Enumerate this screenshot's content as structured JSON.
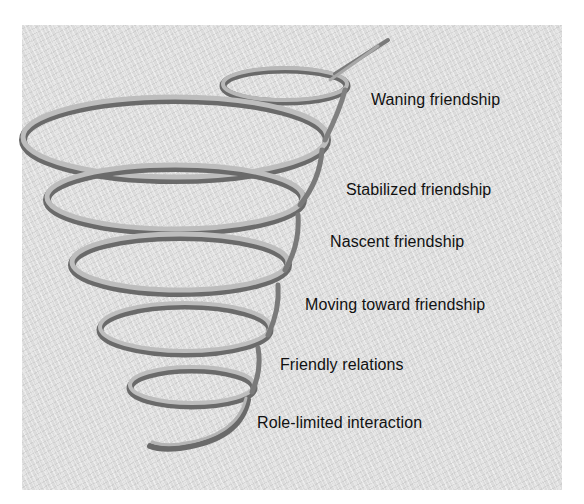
{
  "diagram": {
    "type": "spiral",
    "stages": [
      {
        "label": "Waning friendship",
        "order": 6
      },
      {
        "label": "Stabilized friendship",
        "order": 5
      },
      {
        "label": "Nascent friendship",
        "order": 4
      },
      {
        "label": "Moving toward friendship",
        "order": 3
      },
      {
        "label": "Friendly relations",
        "order": 2
      },
      {
        "label": "Role-limited interaction",
        "order": 1
      }
    ],
    "colors": {
      "background": "#dcdcdc",
      "ribbon_light": "#b4b4b4",
      "ribbon_dark": "#6a6a6a",
      "text": "#111111"
    }
  }
}
